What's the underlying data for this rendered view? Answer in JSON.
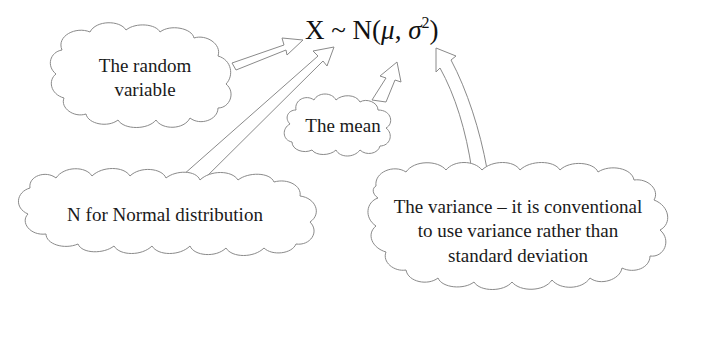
{
  "formula": {
    "variable": "X",
    "tilde": "~",
    "dist": "N(",
    "mu": "μ",
    "comma": ",",
    "sigma": "σ",
    "power": "2",
    "close": ")"
  },
  "callouts": {
    "random_variable": {
      "line1": "The random",
      "line2": "variable"
    },
    "mean": "The mean",
    "normal": "N for Normal distribution",
    "variance": {
      "line1": "The variance – it is conventional",
      "line2": "to use variance rather than",
      "line3": "standard deviation"
    }
  },
  "colors": {
    "outline": "#8a8a8a",
    "text": "#1a1a1a",
    "background": "#ffffff"
  }
}
